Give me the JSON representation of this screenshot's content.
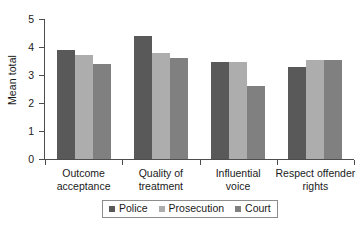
{
  "chart_data": {
    "type": "bar",
    "title": "",
    "xlabel": "",
    "ylabel": "Mean total",
    "ylim": [
      0,
      5
    ],
    "yticks": [
      "0",
      "1",
      "2",
      "3",
      "4",
      "5"
    ],
    "grid": false,
    "legend_position": "bottom",
    "categories": [
      {
        "line1": "Outcome",
        "line2": "acceptance"
      },
      {
        "line1": "Quality of",
        "line2": "treatment"
      },
      {
        "line1": "Influential",
        "line2": "voice"
      },
      {
        "line1": "Respect offender",
        "line2": "rights"
      }
    ],
    "category_labels": [
      "Outcome acceptance",
      "Quality of treatment",
      "Influential voice",
      "Respect offender rights"
    ],
    "series": [
      {
        "name": "Police",
        "color": "#595959",
        "values": [
          3.9,
          4.4,
          3.45,
          3.3
        ]
      },
      {
        "name": "Prosecution",
        "color": "#adadad",
        "values": [
          3.7,
          3.8,
          3.45,
          3.55
        ]
      },
      {
        "name": "Court",
        "color": "#808080",
        "values": [
          3.4,
          3.6,
          2.6,
          3.55
        ]
      }
    ]
  },
  "legend": {
    "items": [
      {
        "label": "Police"
      },
      {
        "label": "Prosecution"
      },
      {
        "label": "Court"
      }
    ]
  }
}
